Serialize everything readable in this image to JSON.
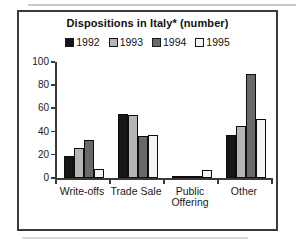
{
  "chart_data": {
    "type": "bar",
    "title": "Dispositions in Italy* (number)",
    "categories": [
      "Write-offs",
      "Trade Sale",
      "Public Offering",
      "Other"
    ],
    "series": [
      {
        "name": "1992",
        "color": "#161616",
        "values": [
          19,
          55,
          2,
          37
        ]
      },
      {
        "name": "1993",
        "color": "#b5b5b5",
        "values": [
          26,
          54,
          2,
          45
        ]
      },
      {
        "name": "1994",
        "color": "#696969",
        "values": [
          33,
          36,
          2,
          90
        ]
      },
      {
        "name": "1995",
        "color": "#f4f4f1",
        "values": [
          8,
          37,
          7,
          51
        ]
      }
    ],
    "xlabel": "",
    "ylabel": "",
    "ylim": [
      0,
      100
    ],
    "yticks": [
      0,
      20,
      40,
      60,
      80,
      100
    ],
    "grid": false,
    "legend_position": "top"
  },
  "decor": {
    "top_rule_color": "#c9c9c9",
    "bottom_rule_color": "#d9d9d9",
    "frame_border_color": "#3a3a3a"
  }
}
